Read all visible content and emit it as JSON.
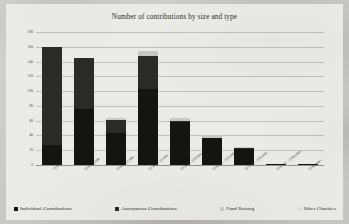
{
  "chart_data": {
    "type": "bar",
    "subtype": "stacked-column",
    "title": "Number of contributions by size and type",
    "xlabel": "",
    "ylabel": "",
    "ylim": [
      0,
      180
    ],
    "ytick_step": 20,
    "yticks": [
      "0",
      "20",
      "40",
      "60",
      "80",
      "100",
      "120",
      "140",
      "160",
      "180"
    ],
    "grid": true,
    "legend_position": "bottom",
    "categories": [
      "<£100",
      "£101 - £500",
      "£501 - £1,000",
      "£1,001 - £5,000",
      "£5,001 - £10,000",
      "£10,001 - £25,000",
      "£25,001 - £50,000",
      "£50,001 - £100,000",
      "£100,000+"
    ],
    "series": [
      {
        "name": "Individual Contributions",
        "color": "#15140f",
        "values": [
          27,
          76,
          43,
          103,
          58,
          36,
          22,
          2,
          1
        ]
      },
      {
        "name": "Anonymous Contributions",
        "color": "#2b2a24",
        "values": [
          133,
          69,
          18,
          45,
          2,
          1,
          1,
          0,
          0
        ]
      },
      {
        "name": "Fund Raising",
        "color": "#c9c7c0",
        "values": [
          0,
          0,
          3,
          6,
          3,
          3,
          1,
          0,
          0
        ]
      },
      {
        "name": "Other Charities",
        "color": "#dedcd5",
        "values": [
          0,
          0,
          0,
          0,
          0,
          0,
          0,
          0,
          0
        ]
      }
    ],
    "totals": [
      160,
      145,
      64,
      154,
      63,
      40,
      24,
      2,
      1
    ]
  }
}
